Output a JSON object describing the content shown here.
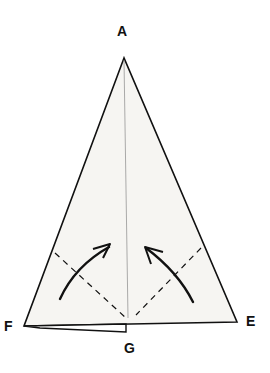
{
  "diagram": {
    "type": "origami-fold-step",
    "labels": {
      "A": "A",
      "E": "E",
      "F": "F",
      "G": "G"
    },
    "colors": {
      "line": "#111111",
      "paper": "#f6f5f2",
      "background": "#ffffff"
    },
    "points": {
      "A": [
        124,
        58
      ],
      "F": [
        24,
        326
      ],
      "E": [
        237,
        322
      ],
      "G": [
        126,
        324
      ]
    },
    "elements": [
      "triangle outline A-F-E",
      "thin center crease from A to G",
      "dashed valley-fold line left",
      "dashed valley-fold line right",
      "curved fold arrow left pointing up-right",
      "curved fold arrow right pointing up-left",
      "folded flap under edge F-G"
    ]
  }
}
